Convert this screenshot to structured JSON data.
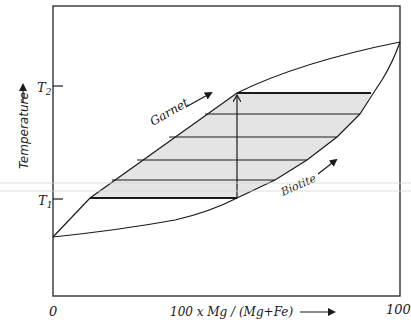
{
  "diagram": {
    "title": "",
    "x_axis": {
      "label": "100 x Mg / (Mg+Fe)",
      "min_label": "0",
      "max_label": "100"
    },
    "y_axis": {
      "label": "Temperature",
      "ticks": [
        "T2",
        "T1"
      ],
      "t2_label": "T",
      "t2_sub": "2",
      "t1_label": "T",
      "t1_sub": "1"
    },
    "phases": {
      "upper": "Garnet",
      "lower": "Biotite"
    },
    "tie_lines_count": 6,
    "colors": {
      "line": "#1a1a1a",
      "two_phase_fill": "#e4e4e4",
      "frame": "#333333",
      "scan_artifact": "#d6d6d6"
    }
  }
}
